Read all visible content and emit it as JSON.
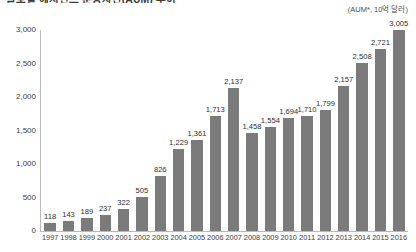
{
  "header": {
    "title": "글로벌 헤지펀드 운용자산(AUM) 추이",
    "unit_label": "(AUM*, 10억 달러)"
  },
  "chart_data": {
    "type": "bar",
    "title": "글로벌 헤지펀드 운용자산(AUM) 추이",
    "xlabel": "",
    "ylabel": "",
    "unit": "(AUM*, 10억 달러)",
    "ylim": [
      0,
      3000
    ],
    "yticks": [
      0,
      500,
      1000,
      1500,
      2000,
      2500,
      3000
    ],
    "ytick_labels": [
      "0",
      "500",
      "1,000",
      "1,500",
      "2,000",
      "2,500",
      "3,000"
    ],
    "grid": false,
    "legend": "none",
    "bar_color": "#7b7b7b",
    "axis_color": "#b9b9b9",
    "categories": [
      "1997",
      "1998",
      "1999",
      "2000",
      "2001",
      "2002",
      "2003",
      "2004",
      "2005",
      "2006",
      "2007",
      "2008",
      "2009",
      "2010",
      "2011",
      "2012",
      "2013",
      "2014",
      "2015",
      "2016"
    ],
    "values": [
      118,
      143,
      189,
      237,
      322,
      505,
      826,
      1229,
      1361,
      1713,
      2137,
      1458,
      1554,
      1694,
      1710,
      1799,
      2157,
      2508,
      2721,
      3005
    ],
    "value_labels": [
      "118",
      "143",
      "189",
      "237",
      "322",
      "505",
      "826",
      "1,229",
      "1,361",
      "1,713",
      "2,137",
      "1,458",
      "1,554",
      "1,694",
      "1,710",
      "1,799",
      "2,157",
      "2,508",
      "2,721",
      "3,005"
    ]
  }
}
